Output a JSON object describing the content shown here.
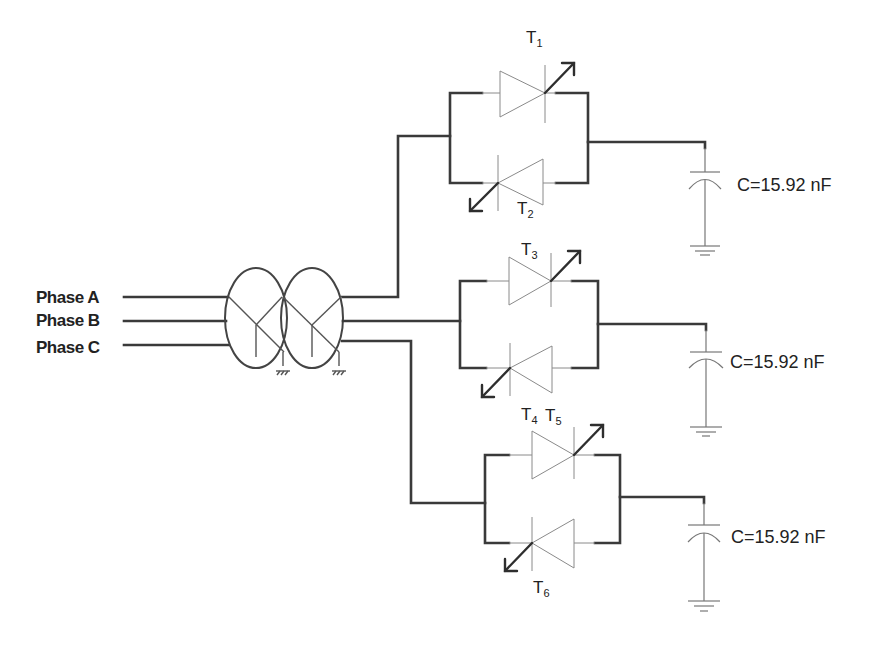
{
  "diagram": {
    "type": "circuit-schematic",
    "colors": {
      "wire": "#3a3a3a",
      "component": "#8a8a8a",
      "text": "#222222",
      "background": "#ffffff"
    },
    "inputs": {
      "phases": [
        {
          "label": "Phase A"
        },
        {
          "label": "Phase B"
        },
        {
          "label": "Phase C"
        }
      ]
    },
    "transformer": {
      "type": "Y-Y",
      "windings": 2,
      "grounded": true
    },
    "branches": [
      {
        "upper_thyristor": {
          "name": "T",
          "sub": "1"
        },
        "lower_thyristor": {
          "name": "T",
          "sub": "2"
        },
        "capacitor": {
          "label": "C=15.92 nF"
        }
      },
      {
        "upper_thyristor": {
          "name": "T",
          "sub": "3"
        },
        "lower_thyristor": {
          "name": "T",
          "sub": "4"
        },
        "capacitor": {
          "label": "C=15.92 nF"
        }
      },
      {
        "upper_thyristor": {
          "name": "T",
          "sub": "5"
        },
        "lower_thyristor": {
          "name": "T",
          "sub": "6"
        },
        "capacitor": {
          "label": "C=15.92 nF"
        }
      }
    ]
  }
}
